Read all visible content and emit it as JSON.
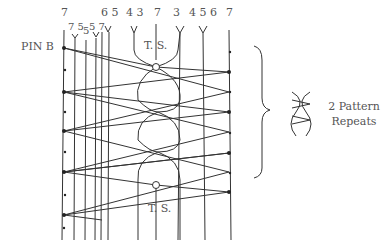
{
  "diagram": {
    "pin_label": "PIN B",
    "top_labels": [
      {
        "text": "7",
        "x": 61,
        "y": 15
      },
      {
        "text": "6 5",
        "x": 101,
        "y": 15
      },
      {
        "text": "4 3",
        "x": 126,
        "y": 15
      },
      {
        "text": "7",
        "x": 155,
        "y": 15
      },
      {
        "text": "3",
        "x": 172,
        "y": 15
      },
      {
        "text": "4 5 6",
        "x": 190,
        "y": 15
      },
      {
        "text": "7",
        "x": 227,
        "y": 15
      }
    ],
    "second_row_labels": [
      {
        "text": "7 5",
        "x": 69,
        "y": 27
      },
      {
        "text": "5",
        "x": 83,
        "y": 32
      },
      {
        "text": "5 7",
        "x": 89,
        "y": 27
      }
    ],
    "ts_top": "T.  S.",
    "ts_bottom": "T.  S.",
    "brace_annotation": "2 Pattern Repeats",
    "repeats_line1": "2 Pattern",
    "repeats_line2": "Repeats",
    "stroke_color": "#333333"
  }
}
